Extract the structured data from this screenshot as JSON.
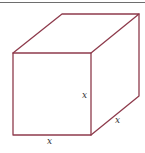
{
  "figure": {
    "type": "cube",
    "edge_color": "#8e3b4c",
    "labels": {
      "front_bottom": "x",
      "front_right": "x",
      "depth": "x"
    }
  }
}
